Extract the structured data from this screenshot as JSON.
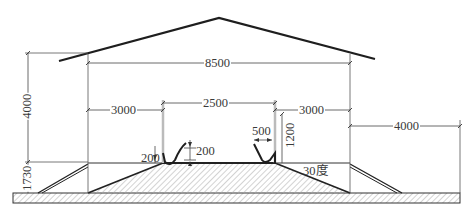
{
  "drawing": {
    "title": "Cross-section of shed with embankment and gutters",
    "colors": {
      "line": "#2a2a2a",
      "thin": "#555555",
      "hatch": "#9a9a9a",
      "background": "#ffffff"
    },
    "dimensions": {
      "total_width": "8500",
      "left_span": "3000",
      "center_span": "2500",
      "right_span": "3000",
      "outer_right": "4000",
      "wall_height": "4000",
      "embankment_height": "1730",
      "gutter_left_depth": "200",
      "gutter_right_depth": "200",
      "gutter_width": "500",
      "post_height": "1200",
      "slope_angle": "30度"
    }
  }
}
